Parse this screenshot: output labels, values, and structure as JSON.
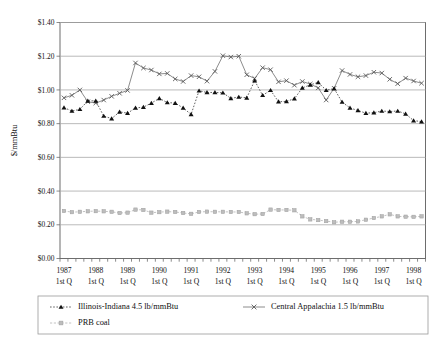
{
  "chart_data": {
    "type": "line",
    "title": "",
    "subtitle": "",
    "xlabel": "",
    "ylabel": "$/mmBtu",
    "ylim": [
      0.0,
      1.4
    ],
    "ytick_labels": [
      "$0.00",
      "$0.20",
      "$0.40",
      "$0.60",
      "$0.80",
      "$1.00",
      "$1.20",
      "$1.40"
    ],
    "ytick_values": [
      0.0,
      0.2,
      0.4,
      0.6,
      0.8,
      1.0,
      1.2,
      1.4
    ],
    "grid": true,
    "legend_position": "bottom",
    "x_major_labels": [
      "1987",
      "1988",
      "1989",
      "1990",
      "1991",
      "1992",
      "1993",
      "1994",
      "1995",
      "1996",
      "1997",
      "1998"
    ],
    "x_major_sublabel": "1st Q",
    "x_quarters_per_year": 4,
    "x": [
      "1987 Q1",
      "1987 Q2",
      "1987 Q3",
      "1987 Q4",
      "1988 Q1",
      "1988 Q2",
      "1988 Q3",
      "1988 Q4",
      "1989 Q1",
      "1989 Q2",
      "1989 Q3",
      "1989 Q4",
      "1990 Q1",
      "1990 Q2",
      "1990 Q3",
      "1990 Q4",
      "1991 Q1",
      "1991 Q2",
      "1991 Q3",
      "1991 Q4",
      "1992 Q1",
      "1992 Q2",
      "1992 Q3",
      "1992 Q4",
      "1993 Q1",
      "1993 Q2",
      "1993 Q3",
      "1993 Q4",
      "1994 Q1",
      "1994 Q2",
      "1994 Q3",
      "1994 Q4",
      "1995 Q1",
      "1995 Q2",
      "1995 Q3",
      "1995 Q4",
      "1996 Q1",
      "1996 Q2",
      "1996 Q3",
      "1996 Q4",
      "1997 Q1",
      "1997 Q2",
      "1997 Q3",
      "1997 Q4",
      "1998 Q1",
      "1998 Q2"
    ],
    "series": [
      {
        "name": "Illinois-Indiana 4.5 lb/mmBtu",
        "marker": "triangle",
        "line_style": "dotted",
        "color": "#111111",
        "values": [
          0.895,
          0.875,
          0.885,
          0.935,
          0.935,
          0.845,
          0.83,
          0.87,
          0.862,
          0.893,
          0.898,
          0.922,
          0.95,
          0.925,
          0.922,
          0.893,
          0.855,
          0.995,
          0.985,
          0.985,
          0.983,
          0.95,
          0.958,
          0.953,
          1.055,
          0.968,
          0.998,
          0.93,
          0.932,
          0.948,
          1.012,
          1.03,
          1.045,
          0.998,
          1.008,
          0.928,
          0.893,
          0.878,
          0.862,
          0.865,
          0.875,
          0.872,
          0.875,
          0.858,
          0.818,
          0.812
        ]
      },
      {
        "name": "Central Appalachia 1.5 lb/mmBtu",
        "marker": "cross",
        "line_style": "solid",
        "color": "#5a5a5a",
        "values": [
          0.953,
          0.968,
          1.0,
          0.93,
          0.922,
          0.94,
          0.962,
          0.98,
          0.997,
          1.16,
          1.13,
          1.118,
          1.095,
          1.098,
          1.065,
          1.05,
          1.085,
          1.078,
          1.052,
          1.11,
          1.203,
          1.195,
          1.2,
          1.09,
          1.068,
          1.132,
          1.12,
          1.048,
          1.055,
          1.028,
          1.05,
          1.035,
          1.012,
          0.94,
          1.01,
          1.115,
          1.092,
          1.078,
          1.085,
          1.105,
          1.1,
          1.063,
          1.037,
          1.07,
          1.053,
          1.04
        ]
      },
      {
        "name": "PRB coal",
        "marker": "square",
        "line_style": "dashed",
        "color": "#bdbdbd",
        "values": [
          0.282,
          0.275,
          0.277,
          0.28,
          0.281,
          0.28,
          0.277,
          0.27,
          0.272,
          0.29,
          0.288,
          0.272,
          0.275,
          0.278,
          0.276,
          0.27,
          0.265,
          0.276,
          0.278,
          0.277,
          0.277,
          0.276,
          0.276,
          0.268,
          0.263,
          0.264,
          0.29,
          0.288,
          0.288,
          0.286,
          0.25,
          0.232,
          0.228,
          0.222,
          0.215,
          0.218,
          0.218,
          0.22,
          0.23,
          0.24,
          0.25,
          0.262,
          0.25,
          0.248,
          0.247,
          0.25
        ]
      }
    ]
  },
  "legend": {
    "entries": [
      {
        "label": "Illinois-Indiana 4.5 lb/mmBtu",
        "marker": "triangle-marker"
      },
      {
        "label": "Central Appalachia 1.5 lb/mmBtu",
        "marker": "cross-marker"
      },
      {
        "label": "PRB coal",
        "marker": "square-marker"
      }
    ]
  }
}
